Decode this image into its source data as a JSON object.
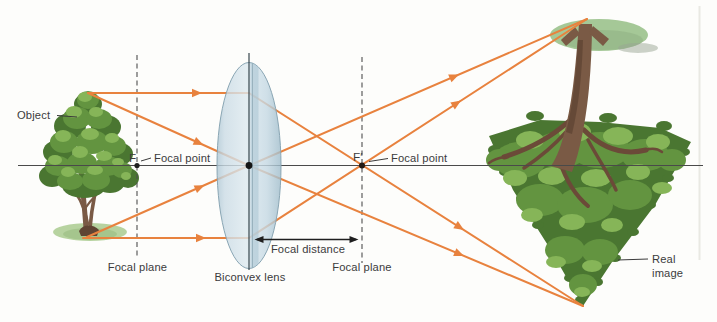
{
  "figure": {
    "labels": {
      "object": "Object",
      "f": "F",
      "focal_point_left": "Focal point",
      "focal_plane_left": "Focal plane",
      "biconvex_lens": "Biconvex lens",
      "focal_distance": "Focal distance",
      "f_prime": "F′",
      "focal_point_right": "Focal point",
      "focal_plane_right": "Focal plane",
      "real_image_line1": "Real",
      "real_image_line2": "image"
    },
    "colors": {
      "ray": "#e8823e",
      "axis": "#4a4a4a",
      "dashed_line": "#4f4f4f",
      "label_text": "#3b3b3b",
      "lens_edge": "#8aa6b4",
      "lens_fill": "#cfe0ea",
      "foliage_dark": "#4a7631",
      "foliage_mid": "#639440",
      "foliage_light": "#86b558",
      "trunk": "#7a5a45",
      "trunk_dark": "#5f4433",
      "root_brown": "#6b4a38",
      "mound_object": "#b7d3a0",
      "mound_image": "#a5c897",
      "arrow_black": "#1f1f1f"
    }
  }
}
